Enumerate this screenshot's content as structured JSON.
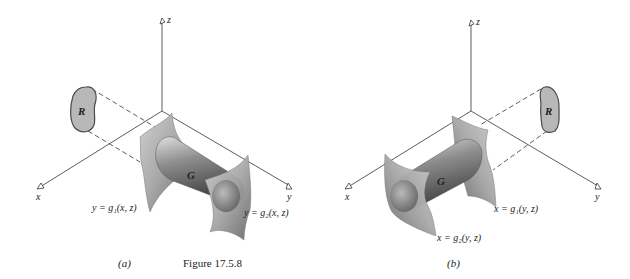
{
  "figure": {
    "caption": "Figure 17.5.8",
    "colors": {
      "background": "#ffffff",
      "axis": "#333333",
      "region_fill": "#b8b8b8",
      "region_stroke": "#4a4a4a",
      "surface_light": "#d4d4d4",
      "surface_dark": "#555555"
    }
  },
  "panels": [
    {
      "id": "a",
      "label": "(a)",
      "axes": {
        "x": "x",
        "y": "y",
        "z": "z"
      },
      "region_label": "R",
      "solid_label": "G",
      "surface_lower": "y = g₁(x, z)",
      "surface_upper": "y = g₂(x, z)",
      "projection_plane": "xz"
    },
    {
      "id": "b",
      "label": "(b)",
      "axes": {
        "x": "x",
        "y": "y",
        "z": "z"
      },
      "region_label": "R",
      "solid_label": "G",
      "surface_lower": "x = g₁(y, z)",
      "surface_upper": "x = g₂(y, z)",
      "projection_plane": "yz"
    }
  ]
}
